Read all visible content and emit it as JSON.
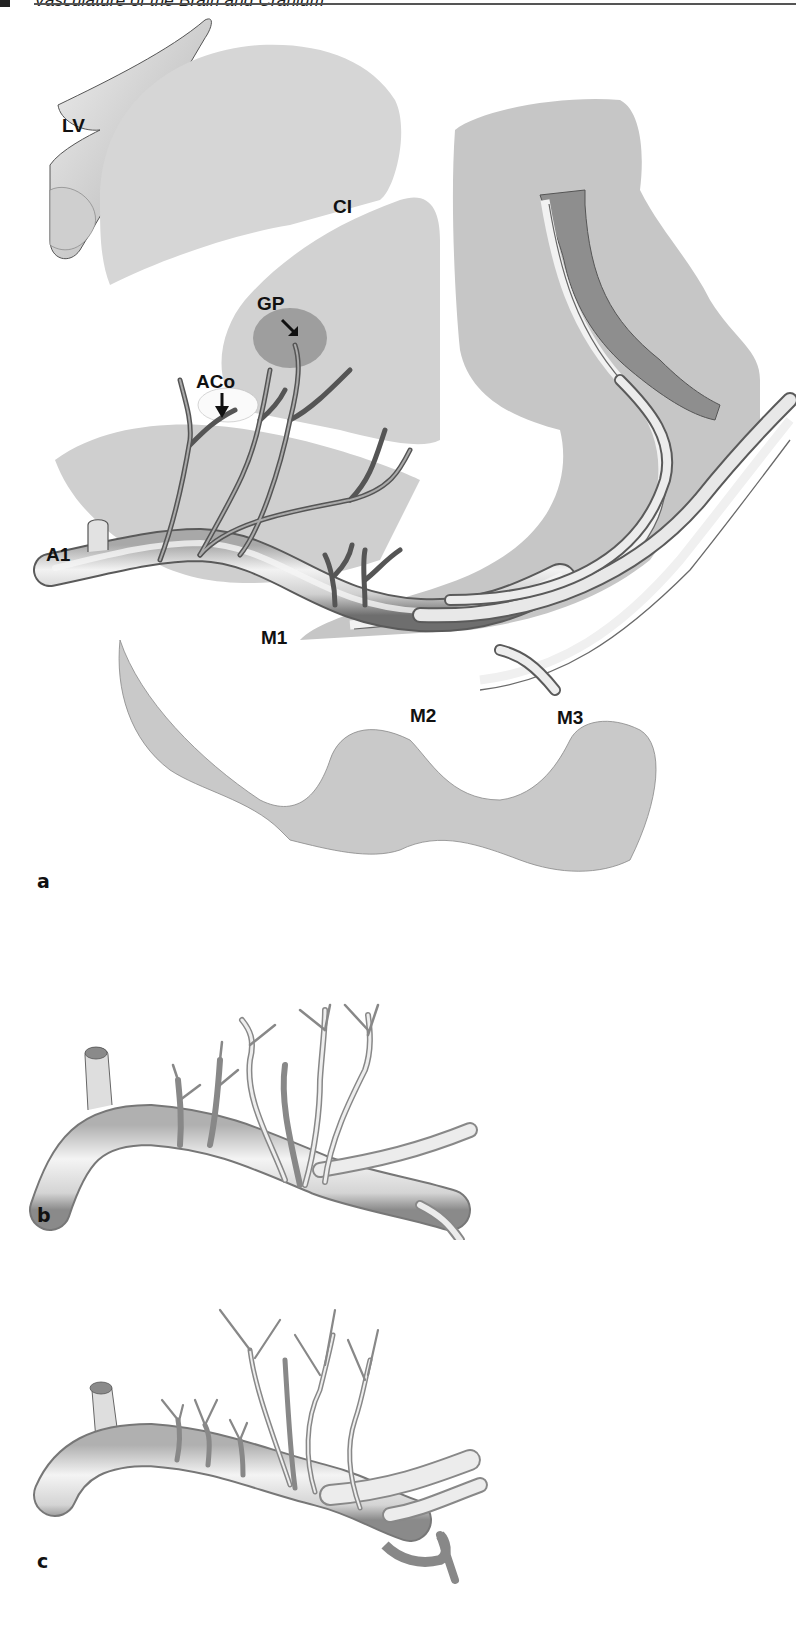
{
  "running_head": {
    "text": "Vasculature of the Brain and Cranium",
    "partially_visible": true
  },
  "figure": {
    "panels": [
      {
        "id": "a",
        "letter": "a",
        "labels": {
          "lv": "LV",
          "ci": "CI",
          "gp": "GP",
          "aco": "ACo",
          "a1": "A1",
          "m1": "M1",
          "m2": "M2",
          "m3": "M3"
        },
        "arrows": [
          "gp-arrow",
          "aco-arrow"
        ]
      },
      {
        "id": "b",
        "letter": "b"
      },
      {
        "id": "c",
        "letter": "c"
      }
    ]
  },
  "colors": {
    "tissue_light": "#d9d9d9",
    "tissue_mid": "#bdbdbd",
    "tissue_dark": "#9a9a9a",
    "vessel_fill": "#e6e6e6",
    "vessel_shadow": "#7a7a7a",
    "label": "#111111"
  }
}
